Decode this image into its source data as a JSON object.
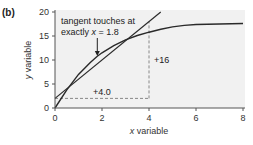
{
  "panel_label": "(b)",
  "colors": {
    "plot_background": "#f1f1f1",
    "curve": "#2a2a2a",
    "tangent": "#2a2a2a",
    "dashed": "#888888",
    "axis": "#555555"
  },
  "chart_data": {
    "type": "line",
    "title": "",
    "xlabel": "x variable",
    "ylabel": "y variable",
    "xlim": [
      0,
      8
    ],
    "ylim": [
      0,
      20
    ],
    "x_ticks": [
      0,
      2,
      4,
      6,
      8
    ],
    "y_ticks": [
      0,
      5,
      10,
      15,
      20
    ],
    "grid": false,
    "series": [
      {
        "name": "curve",
        "x": [
          0,
          0.5,
          1,
          1.5,
          1.8,
          2,
          2.5,
          3,
          3.5,
          4,
          4.5,
          5,
          5.5,
          6,
          7,
          8
        ],
        "y": [
          0,
          3.8,
          7.0,
          9.5,
          10.8,
          11.5,
          13.0,
          14.2,
          15.1,
          15.8,
          16.4,
          16.9,
          17.2,
          17.4,
          17.5,
          17.6
        ]
      },
      {
        "name": "tangent",
        "x": [
          0,
          4.5
        ],
        "y": [
          2.0,
          20.0
        ],
        "slope": 4.0,
        "touch_x": 1.8
      }
    ],
    "annotations": [
      {
        "text": "tangent touches at",
        "line2": "exactly x = 1.8",
        "points_to_x": 1.8
      },
      {
        "text": "+4.0",
        "type": "run",
        "from": [
          0,
          2
        ],
        "to": [
          4,
          2
        ]
      },
      {
        "text": "+16",
        "type": "rise",
        "from": [
          4,
          2
        ],
        "to": [
          4,
          18
        ]
      }
    ]
  },
  "labels": {
    "annotation_line1": "tangent touches at",
    "annotation_line2_prefix": "exactly ",
    "annotation_line2_var": "x",
    "annotation_line2_suffix": " = 1.8",
    "run_label": "+4.0",
    "rise_label": "+16"
  }
}
